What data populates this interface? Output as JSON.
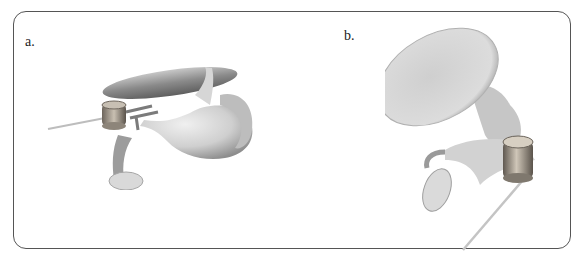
{
  "figure": {
    "panels": [
      {
        "label": "a.",
        "description": "3D rendering of ossicular chain with tympanic membrane, prosthesis actuator and wire (lateral view)"
      },
      {
        "label": "b.",
        "description": "3D rendering of ossicular chain with tympanic membrane, prosthesis actuator and wire (alternate view)"
      }
    ]
  },
  "colors": {
    "frame": "#555555",
    "model_light": "#e2e2e2",
    "model_mid": "#b9b9b9",
    "model_dark": "#7a7a7a",
    "metal": "#9a8f80"
  }
}
